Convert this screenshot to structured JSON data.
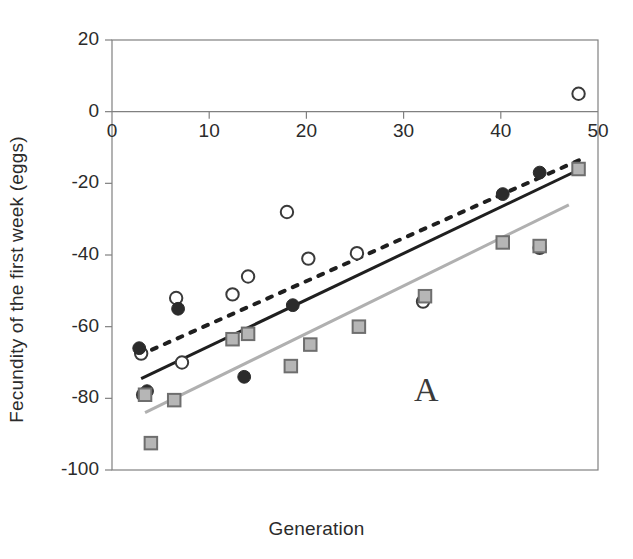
{
  "figure": {
    "panel_label": "A"
  },
  "chart_data": {
    "type": "scatter",
    "title": "",
    "xlabel": "Generation",
    "ylabel": "Fecundity of the first week (eggs)",
    "xlim": [
      0,
      50
    ],
    "ylim": [
      -100,
      20
    ],
    "xticks": [
      0,
      10,
      20,
      30,
      40,
      50
    ],
    "yticks": [
      20,
      0,
      -20,
      -40,
      -60,
      -80,
      -100
    ],
    "xtick_labels": [
      "0",
      "10",
      "20",
      "30",
      "40",
      "50"
    ],
    "ytick_labels": [
      "20",
      "0",
      "-20",
      "-40",
      "-60",
      "-80",
      "-100"
    ],
    "grid": false,
    "legend": "none",
    "colors": {
      "open_circle_edge": "#3a3a3a",
      "open_circle_fill": "#ffffff",
      "filled_circle": "#2b2b2b",
      "square_fill": "#b6b6b6",
      "square_edge": "#6e6e6e",
      "solid_line": "#1f1f1f",
      "dotted_line": "#1f1f1f",
      "gray_line": "#b0b0b0",
      "axis": "#808080"
    },
    "series": [
      {
        "name": "Open circles",
        "marker": "open-circle",
        "points": [
          {
            "x": 3.0,
            "y": -67.5
          },
          {
            "x": 3.2,
            "y": -79.0
          },
          {
            "x": 6.6,
            "y": -52.0
          },
          {
            "x": 7.2,
            "y": -70.0
          },
          {
            "x": 12.4,
            "y": -51.0
          },
          {
            "x": 14.0,
            "y": -46.0
          },
          {
            "x": 18.0,
            "y": -28.0
          },
          {
            "x": 20.2,
            "y": -41.0
          },
          {
            "x": 25.2,
            "y": -39.5
          },
          {
            "x": 32.0,
            "y": -53.0
          },
          {
            "x": 44.0,
            "y": -38.0
          },
          {
            "x": 48.0,
            "y": 5.0
          }
        ]
      },
      {
        "name": "Filled circles",
        "marker": "filled-circle",
        "points": [
          {
            "x": 2.8,
            "y": -66.0
          },
          {
            "x": 3.6,
            "y": -78.0
          },
          {
            "x": 6.8,
            "y": -55.0
          },
          {
            "x": 13.6,
            "y": -74.0
          },
          {
            "x": 18.6,
            "y": -54.0
          },
          {
            "x": 40.2,
            "y": -23.0
          },
          {
            "x": 44.0,
            "y": -17.0
          }
        ]
      },
      {
        "name": "Gray squares",
        "marker": "gray-square",
        "points": [
          {
            "x": 3.4,
            "y": -79.0
          },
          {
            "x": 4.0,
            "y": -92.5
          },
          {
            "x": 6.4,
            "y": -80.5
          },
          {
            "x": 12.4,
            "y": -63.5
          },
          {
            "x": 14.0,
            "y": -62.0
          },
          {
            "x": 18.4,
            "y": -71.0
          },
          {
            "x": 20.4,
            "y": -65.0
          },
          {
            "x": 25.4,
            "y": -60.0
          },
          {
            "x": 32.2,
            "y": -51.5
          },
          {
            "x": 40.2,
            "y": -36.5
          },
          {
            "x": 44.0,
            "y": -37.5
          },
          {
            "x": 48.0,
            "y": -16.0
          }
        ]
      }
    ],
    "trend_lines": [
      {
        "name": "Dotted trend line",
        "style": "dotted",
        "color": "#1f1f1f",
        "x0": 2.8,
        "y0": -68.0,
        "x1": 48.5,
        "y1": -13.0
      },
      {
        "name": "Solid black trend line",
        "style": "solid",
        "color": "#1f1f1f",
        "x0": 3.0,
        "y0": -74.5,
        "x1": 48.2,
        "y1": -16.0
      },
      {
        "name": "Gray trend line",
        "style": "solid",
        "color": "#b0b0b0",
        "x0": 3.4,
        "y0": -84.0,
        "x1": 47.0,
        "y1": -26.0
      }
    ]
  }
}
